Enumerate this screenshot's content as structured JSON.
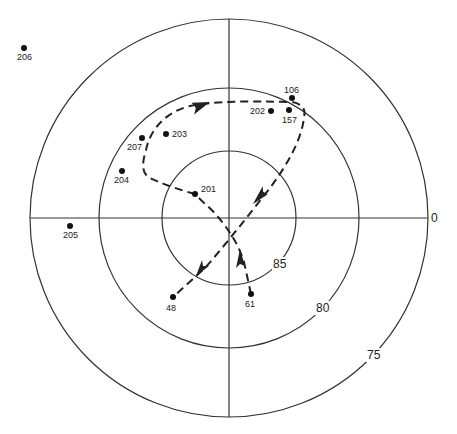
{
  "diagram": {
    "center": {
      "x": 229,
      "y": 218
    },
    "rings": [
      {
        "id": "ring-85",
        "r": 67,
        "label": "85",
        "label_x": 281,
        "label_y": 268
      },
      {
        "id": "ring-80",
        "r": 130,
        "label": "80",
        "label_x": 323,
        "label_y": 313
      },
      {
        "id": "ring-75",
        "r": 199,
        "label": "75",
        "label_x": 373,
        "label_y": 359
      }
    ],
    "axis_label_right": "0",
    "points": [
      {
        "id": "206",
        "label": "206",
        "x": 24,
        "y": 48,
        "lx": 17,
        "ly": 60
      },
      {
        "id": "205",
        "label": "205",
        "x": 70,
        "y": 226,
        "lx": 63,
        "ly": 238
      },
      {
        "id": "204",
        "label": "204",
        "x": 122,
        "y": 171,
        "lx": 114,
        "ly": 183
      },
      {
        "id": "207",
        "label": "207",
        "x": 142,
        "y": 138,
        "lx": 127,
        "ly": 150
      },
      {
        "id": "203",
        "label": "203",
        "x": 166,
        "y": 134,
        "lx": 172,
        "ly": 137
      },
      {
        "id": "201",
        "label": "201",
        "x": 195,
        "y": 194,
        "lx": 201,
        "ly": 192
      },
      {
        "id": "202",
        "label": "202",
        "x": 271,
        "y": 111,
        "lx": 250,
        "ly": 114
      },
      {
        "id": "106",
        "label": "106",
        "x": 292,
        "y": 98,
        "lx": 284,
        "ly": 93
      },
      {
        "id": "157",
        "label": "157",
        "x": 289,
        "y": 110,
        "lx": 282,
        "ly": 123
      },
      {
        "id": "48",
        "label": "48",
        "x": 173,
        "y": 297,
        "lx": 166,
        "ly": 311
      },
      {
        "id": "61",
        "label": "61",
        "x": 251,
        "y": 294,
        "lx": 245,
        "ly": 307
      }
    ],
    "tracks": [
      {
        "id": "track-loop",
        "description": "201 -> loop past 207/203 -> 106/157 -> down-left to 48"
      },
      {
        "id": "track-61",
        "description": "61 -> upward, crossing near center"
      }
    ]
  }
}
